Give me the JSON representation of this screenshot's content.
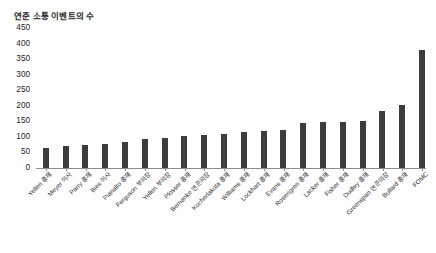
{
  "chart_data": {
    "type": "bar",
    "title": "연준 소통 이벤트의 수",
    "xlabel": "",
    "ylabel": "",
    "ylim": [
      0,
      450
    ],
    "ytick_values": [
      450,
      400,
      350,
      300,
      250,
      200,
      150,
      100,
      50,
      0
    ],
    "ytick_labels": [
      "450",
      "400",
      "350",
      "300",
      "250",
      "200",
      "150",
      "100",
      "50",
      "0"
    ],
    "grid": false,
    "legend": false,
    "bar_color": "#3d3d3d",
    "background_color": "#ffffff",
    "categories": [
      "Yellen 총재",
      "Meyer 이사",
      "Parry 총재",
      "Bies 이사",
      "Pianalto 총재",
      "Ferguson 부의장",
      "Yellen 부의장",
      "Plosser 총재",
      "Bernanke 연준의장",
      "Kocherlakota 총재",
      "Williams 총재",
      "Lockhart 총재",
      "Evans 총재",
      "Rosengren 총재",
      "Lacker 총재",
      "Fisher 총재",
      "Dudley 총재",
      "Greenspan 연준의장",
      "Bullard 총재",
      "FOMC"
    ],
    "values": [
      62,
      70,
      73,
      77,
      83,
      92,
      96,
      102,
      105,
      108,
      113,
      117,
      122,
      142,
      146,
      146,
      150,
      181,
      203,
      378
    ]
  }
}
